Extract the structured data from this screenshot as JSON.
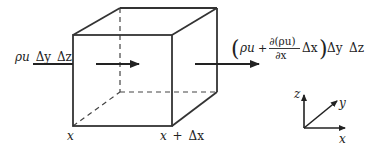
{
  "figure": {
    "type": "control-volume-mass-flux-diagram",
    "stroke_color": "#333333",
    "text_color": "#222222",
    "background": "#ffffff"
  },
  "cube": {
    "front_face": {
      "top_left": [
        73,
        35
      ],
      "top_right": [
        172,
        35
      ],
      "bottom_right": [
        172,
        126
      ],
      "bottom_left": [
        73,
        126
      ]
    },
    "back_face": {
      "top_left": [
        120,
        8
      ],
      "top_right": [
        217,
        8
      ],
      "bottom_right": [
        217,
        92
      ],
      "bottom_left": [
        120,
        92
      ]
    },
    "hidden_edges_style": "dashed"
  },
  "labels": {
    "inflow": {
      "rho_u": "ρu",
      "dy": "Δy",
      "dz": "Δz"
    },
    "outflow": {
      "open_paren": "(",
      "rho_u": "ρu",
      "plus": "+",
      "numerator": "∂(ρu)",
      "denominator": "∂x",
      "dx": "Δx",
      "close_paren": ")",
      "dy": "Δy",
      "dz": "Δz"
    },
    "left_position": "x",
    "right_position_x": "x",
    "right_position_plus": "+",
    "right_position_dx": "Δx"
  },
  "axes": {
    "origin": [
      304,
      128
    ],
    "x_label": "x",
    "y_label": "y",
    "z_label": "z"
  },
  "arrows": [
    {
      "name": "inflow-line",
      "from": [
        33,
        64
      ],
      "to": [
        73,
        64
      ],
      "arrowhead": false
    },
    {
      "name": "interior-flow-arrow",
      "from": [
        96,
        64
      ],
      "to": [
        139,
        64
      ],
      "arrowhead": true
    },
    {
      "name": "outflow-arrow",
      "from": [
        195,
        64
      ],
      "to": [
        259,
        64
      ],
      "arrowhead": true
    }
  ]
}
